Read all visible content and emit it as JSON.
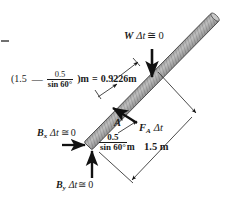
{
  "figure": {
    "type": "free-body-impulse-diagram",
    "background_color": "#ffffff",
    "ink_color": "#1a1a1a",
    "rod_color": "#9a9a9a"
  },
  "rod": {
    "name": "rod",
    "angle_deg": 60,
    "lower_end_point": "B",
    "upper_end_point": "top",
    "fill": "#a8a8a8",
    "hatch": "#555555"
  },
  "labels": {
    "weight_impulse": {
      "W": "W",
      "delta_t": "Δt",
      "approx_eq": "≅",
      "zero": "0",
      "full": "W Δt ≅ 0"
    },
    "bx_impulse": {
      "B": "B",
      "sub": "x",
      "delta_t": "Δt",
      "approx_eq": "≅",
      "zero": "0",
      "full": "Bx Δt ≅ 0"
    },
    "by_impulse": {
      "B": "B",
      "sub": "y",
      "delta_t": "Δt",
      "approx_eq": "≅",
      "zero": "0",
      "full": "By Δt ≅ 0"
    },
    "fa_impulse": {
      "F": "F",
      "sub": "A",
      "delta_t": "Δt",
      "full": "FA Δt"
    },
    "point_a": "A",
    "top_expression": {
      "open_paren": "(",
      "lead": "1.5",
      "minus": "—",
      "frac_num": "0.5",
      "frac_den": "sin 60°",
      "close_paren": ")m",
      "equals": "=",
      "result": "0.9226m",
      "full": "(1.5 — 0.5/sin 60° )m = 0.9226m"
    },
    "lower_distance": {
      "frac_num": "0.5",
      "frac_den": "sin 60°",
      "unit": "m",
      "full": "0.5/sin 60° m"
    },
    "total_length": "1.5 m"
  },
  "arrows": {
    "weight": {
      "name": "weight-impulse-arrow",
      "direction": "down"
    },
    "bx": {
      "name": "bx-impulse-arrow",
      "direction": "right"
    },
    "by": {
      "name": "by-impulse-arrow",
      "direction": "up"
    },
    "fa": {
      "name": "fa-impulse-arrow",
      "direction": "up-left"
    }
  }
}
